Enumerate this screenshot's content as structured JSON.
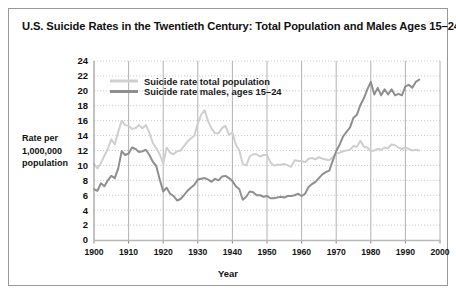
{
  "frame": {
    "border_color": "#9a9a9a",
    "background": "#ffffff"
  },
  "header": {
    "title": "U.S. Suicide Rates in the Twentieth Century: Total Population and Males Ages 15–24"
  },
  "axis": {
    "ylabel_line1": "Rate per",
    "ylabel_line2": "1,000,000",
    "ylabel_line3": "population",
    "xlabel": "Year"
  },
  "legend": {
    "position": "top-left-inside",
    "items": [
      {
        "label": "Suicide rate total population",
        "color": "#cfcfcf"
      },
      {
        "label": "Suicide rate males, ages 15–24",
        "color": "#8f8f8f"
      }
    ]
  },
  "chart_data": {
    "type": "line",
    "title": "U.S. Suicide Rates in the Twentieth Century: Total Population and Males Ages 15–24",
    "xlabel": "Year",
    "ylabel": "Rate per 1,000,000 population",
    "xlim": [
      1900,
      2000
    ],
    "ylim": [
      0,
      24
    ],
    "xticks": [
      1900,
      1910,
      1920,
      1930,
      1940,
      1950,
      1960,
      1970,
      1980,
      1990,
      2000
    ],
    "yticks": [
      0,
      2,
      4,
      6,
      8,
      10,
      12,
      14,
      16,
      18,
      20,
      22,
      24
    ],
    "grid": "horizontal dotted, vertical solid light gray",
    "legend_position": "upper left inside plot",
    "x": [
      1900,
      1901,
      1902,
      1903,
      1904,
      1905,
      1906,
      1907,
      1908,
      1909,
      1910,
      1911,
      1912,
      1913,
      1914,
      1915,
      1916,
      1917,
      1918,
      1919,
      1920,
      1921,
      1922,
      1923,
      1924,
      1925,
      1926,
      1927,
      1928,
      1929,
      1930,
      1931,
      1932,
      1933,
      1934,
      1935,
      1936,
      1937,
      1938,
      1939,
      1940,
      1941,
      1942,
      1943,
      1944,
      1945,
      1946,
      1947,
      1948,
      1949,
      1950,
      1951,
      1952,
      1953,
      1954,
      1955,
      1956,
      1957,
      1958,
      1959,
      1960,
      1961,
      1962,
      1963,
      1964,
      1965,
      1966,
      1967,
      1968,
      1969,
      1970,
      1971,
      1972,
      1973,
      1974,
      1975,
      1976,
      1977,
      1978,
      1979,
      1980,
      1981,
      1982,
      1983,
      1984,
      1985,
      1986,
      1987,
      1988,
      1989,
      1990,
      1991,
      1992,
      1993,
      1994
    ],
    "series": [
      {
        "name": "Suicide rate total population",
        "color": "#cfcfcf",
        "values": [
          10.2,
          9.6,
          10.3,
          11.3,
          12.2,
          13.5,
          12.8,
          14.5,
          16.0,
          15.4,
          15.3,
          14.9,
          15.0,
          15.4,
          15.0,
          15.4,
          14.4,
          13.0,
          12.3,
          11.5,
          10.2,
          12.4,
          11.7,
          11.5,
          11.9,
          12.0,
          12.6,
          13.2,
          13.6,
          14.0,
          15.6,
          16.8,
          17.4,
          15.9,
          14.9,
          14.3,
          14.3,
          15.0,
          15.3,
          14.1,
          14.4,
          12.8,
          12.0,
          10.2,
          10.0,
          11.2,
          11.5,
          11.5,
          11.2,
          11.4,
          11.4,
          10.4,
          10.0,
          10.1,
          10.1,
          10.2,
          10.0,
          9.8,
          10.7,
          10.6,
          10.6,
          10.4,
          10.9,
          11.0,
          10.8,
          11.1,
          10.9,
          10.8,
          10.7,
          11.1,
          11.6,
          11.7,
          11.9,
          12.0,
          12.1,
          12.6,
          12.5,
          13.3,
          12.5,
          12.4,
          11.9,
          12.0,
          12.2,
          12.1,
          12.4,
          12.3,
          12.8,
          12.7,
          12.4,
          12.2,
          12.4,
          12.2,
          12.0,
          12.1,
          12.0
        ],
        "note_total": "Gray light line; peaks ~17.4 in 1932 and ~16 in 1908; flattens near 11–12 after 1945"
      },
      {
        "name": "Suicide rate males, ages 15–24",
        "color": "#8f8f8f",
        "values": [
          6.8,
          6.6,
          7.6,
          7.2,
          8.0,
          8.6,
          8.3,
          9.6,
          11.9,
          11.4,
          11.6,
          12.4,
          12.2,
          11.8,
          11.9,
          12.1,
          11.4,
          10.5,
          9.9,
          8.1,
          6.5,
          7.0,
          6.2,
          5.9,
          5.3,
          5.5,
          6.0,
          6.6,
          7.0,
          7.4,
          8.1,
          8.2,
          8.3,
          8.1,
          7.8,
          8.2,
          8.0,
          8.5,
          8.6,
          8.3,
          7.9,
          7.2,
          6.8,
          5.4,
          5.8,
          6.5,
          6.4,
          6.0,
          6.0,
          5.8,
          5.9,
          5.6,
          5.6,
          5.7,
          5.8,
          5.7,
          5.9,
          5.9,
          6.0,
          6.2,
          5.9,
          6.2,
          7.1,
          7.5,
          7.8,
          8.3,
          8.8,
          9.1,
          9.3,
          10.6,
          11.9,
          12.8,
          13.9,
          14.5,
          15.1,
          16.4,
          16.8,
          18.1,
          19.0,
          20.2,
          21.2,
          19.5,
          20.4,
          19.4,
          20.2,
          19.5,
          20.2,
          19.4,
          19.6,
          19.4,
          20.6,
          20.8,
          20.4,
          21.2,
          21.5
        ],
        "note_males": "Medium gray line; climbs sharply after 1960, peak ~21.2 in 1980 and ~21.5 in 1994"
      }
    ]
  }
}
